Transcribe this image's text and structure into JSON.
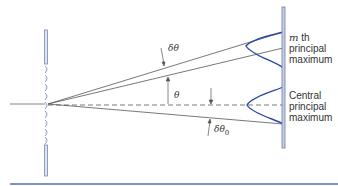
{
  "diagram": {
    "labels": {
      "delta_theta": "δθ",
      "theta": "θ",
      "delta_theta_0": "δθ",
      "delta_theta_0_sub": "0",
      "mth_line1_italic": "m",
      "mth_line1_rest": " th",
      "mth_line2": "principal",
      "mth_line3": "maximum",
      "central_line1": "Central",
      "central_line2": "principal",
      "central_line3": "maximum"
    },
    "colors": {
      "grating_fill": "#dfe3f0",
      "grating_stroke": "#6a78a8",
      "screen_fill": "#c9d0e6",
      "screen_stroke": "#5a6a9e",
      "intensity_curve": "#2e4a9e",
      "ray": "#555555",
      "bottom_rule": "#7d93c4"
    }
  }
}
